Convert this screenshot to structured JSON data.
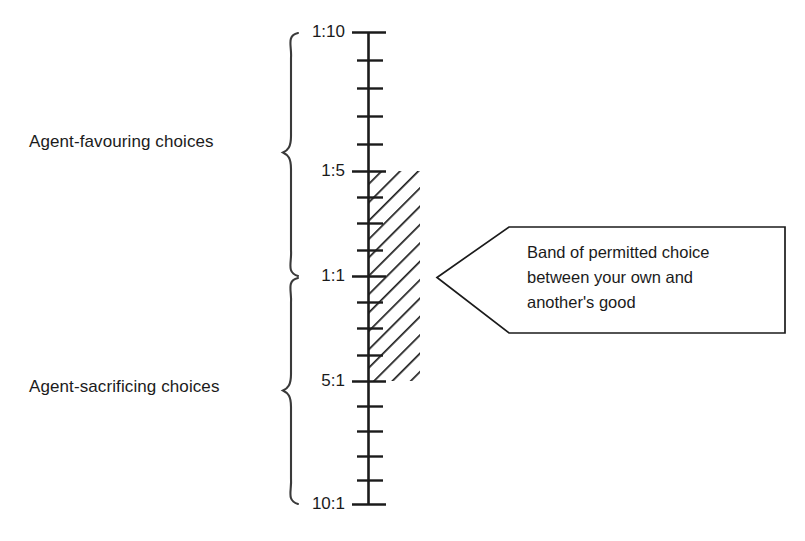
{
  "figure": {
    "title": "",
    "axis": {
      "name": "ratio-scale-axis",
      "orientation": "vertical",
      "top_value": "1:10",
      "bottom_value": "10:1",
      "center_value": "1:1",
      "major_tick_labels": [
        "1:10",
        "1:5",
        "1:1",
        "5:1",
        "10:1"
      ],
      "minor_ticks_between_majors": 4,
      "total_ticks": 21
    },
    "brackets": [
      {
        "name": "bracket-agent-favouring",
        "label": "Agent-favouring choices",
        "from_value": "1:10",
        "to_value": "1:1"
      },
      {
        "name": "bracket-agent-sacrificing",
        "label": "Agent-sacrificing choices",
        "from_value": "1:1",
        "to_value": "10:1"
      }
    ],
    "band": {
      "name": "permitted-choice-band",
      "fill": "diagonal-hatching",
      "from_value": "1:5",
      "to_value": "5:1"
    },
    "callout": {
      "name": "band-callout",
      "lines": [
        "Band of permitted choice",
        "between your own and",
        "another's good"
      ],
      "points_to": "permitted-choice-band"
    },
    "colors": {
      "ink": "#1b1b1b",
      "background": "#ffffff"
    }
  }
}
